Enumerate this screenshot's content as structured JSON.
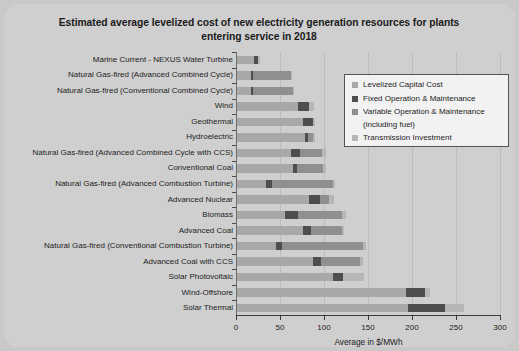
{
  "chart_data": {
    "type": "bar",
    "orientation": "horizontal",
    "stacked": true,
    "title": "Estimated average levelized cost of new electricity generation resources for plants entering service in 2018",
    "xlabel": "Average in $/MWh",
    "ylabel": "",
    "xlim": [
      0,
      300
    ],
    "xticks": [
      0,
      50,
      100,
      150,
      200,
      250,
      300
    ],
    "grid": true,
    "legend_position": "upper-right",
    "series": [
      {
        "name": "Levelized Capital Cost",
        "color": "#a8a8a8",
        "values": [
          20,
          17,
          17,
          70,
          76,
          78,
          63,
          65,
          34,
          83,
          56,
          76,
          46,
          88,
          110,
          193,
          195
        ]
      },
      {
        "name": "Fixed Operation & Maintenance",
        "color": "#4e4e4e",
        "values": [
          5,
          2,
          2,
          13,
          12,
          4,
          10,
          4,
          7,
          12,
          14,
          9,
          6,
          9,
          12,
          22,
          42
        ]
      },
      {
        "name": "Variable Operation & Maintenance (including fuel)",
        "color": "#8f8f8f",
        "values": [
          0,
          44,
          46,
          0,
          0,
          6,
          25,
          30,
          69,
          11,
          50,
          35,
          92,
          44,
          0,
          0,
          0
        ]
      },
      {
        "name": "Transmission Investment",
        "color": "#b6b6b6",
        "values": [
          2,
          1,
          1,
          6,
          2,
          2,
          4,
          3,
          3,
          5,
          5,
          3,
          4,
          3,
          23,
          6,
          22
        ]
      }
    ],
    "categories": [
      "Marine Current - NEXUS Water Turbine",
      "Natural Gas-fired (Advanced Combined Cycle)",
      "Natural Gas-fired (Conventional Combined Cycle)",
      "Wind",
      "Geothermal",
      "Hydroelectric",
      "Natural Gas-fired (Advanced Combined Cycle with CCS)",
      "Conventional Coal",
      "Natural Gas-fired (Advanced Combustion Turbine)",
      "Advanced Nuclear",
      "Biomass",
      "Advanced Coal",
      "Natural Gas-fired (Conventional Combustion Turbine)",
      "Advanced Coal with CCS",
      "Solar Photovoltaic",
      "Wind-Offshore",
      "Solar Thermal"
    ],
    "totals": [
      27,
      64,
      66,
      89,
      90,
      90,
      102,
      102,
      113,
      111,
      125,
      123,
      148,
      144,
      145,
      221,
      259
    ]
  },
  "legend": {
    "items": [
      {
        "label": "Levelized Capital Cost",
        "sub": "",
        "color": "#a8a8a8"
      },
      {
        "label": "Fixed Operation & Maintenance",
        "sub": "",
        "color": "#4e4e4e"
      },
      {
        "label": "Variable Operation & Maintenance",
        "sub": "(including fuel)",
        "color": "#8f8f8f"
      },
      {
        "label": "Transmission Investment",
        "sub": "",
        "color": "#b6b6b6"
      }
    ]
  }
}
